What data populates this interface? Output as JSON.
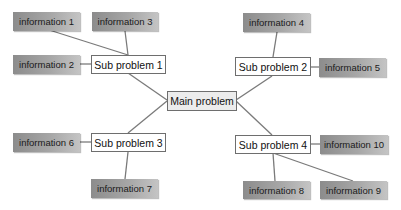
{
  "diagram": {
    "type": "mind-map",
    "colors": {
      "line": "#7a7a7a",
      "info_fill_dark": "#8c8c8c",
      "info_fill_light": "#c4c4c4",
      "main_fill": "#ececec",
      "sub_fill": "#ffffff",
      "border": "#6e6e6e"
    },
    "main": {
      "label": "Main problem"
    },
    "subs": [
      {
        "label": "Sub problem 1"
      },
      {
        "label": "Sub problem 2"
      },
      {
        "label": "Sub problem 3"
      },
      {
        "label": "Sub problem 4"
      }
    ],
    "infos": [
      {
        "label": "information 1"
      },
      {
        "label": "information 2"
      },
      {
        "label": "information 3"
      },
      {
        "label": "information 4"
      },
      {
        "label": "information 5"
      },
      {
        "label": "information 6"
      },
      {
        "label": "information 7"
      },
      {
        "label": "information 8"
      },
      {
        "label": "information 9"
      },
      {
        "label": "information 10"
      }
    ],
    "edges": [
      [
        "Main problem",
        "Sub problem 1"
      ],
      [
        "Main problem",
        "Sub problem 2"
      ],
      [
        "Main problem",
        "Sub problem 3"
      ],
      [
        "Main problem",
        "Sub problem 4"
      ],
      [
        "Sub problem 1",
        "information 1"
      ],
      [
        "Sub problem 1",
        "information 2"
      ],
      [
        "Sub problem 1",
        "information 3"
      ],
      [
        "Sub problem 2",
        "information 4"
      ],
      [
        "Sub problem 2",
        "information 5"
      ],
      [
        "Sub problem 3",
        "information 6"
      ],
      [
        "Sub problem 3",
        "information 7"
      ],
      [
        "Sub problem 4",
        "information 8"
      ],
      [
        "Sub problem 4",
        "information 9"
      ],
      [
        "Sub problem 4",
        "information 10"
      ]
    ]
  }
}
